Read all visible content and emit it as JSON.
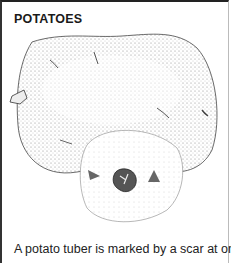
{
  "document": {
    "title": "POTATOES",
    "illustration": {
      "subject": "potato-tuber-drawing",
      "description": "Stippled ink drawing of a potato tuber with a cut section showing the stolon scar"
    },
    "caption": "A potato tuber is marked by a scar at one"
  }
}
